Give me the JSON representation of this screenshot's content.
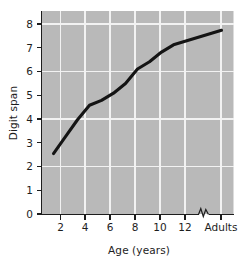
{
  "chart_data": {
    "type": "line",
    "title": "",
    "subtitle": "",
    "xlabel": "Age (years)",
    "ylabel": "Digit span",
    "x_tick_labels": [
      "2",
      "4",
      "6",
      "8",
      "10",
      "12",
      "Adults"
    ],
    "x_tick_values": [
      2,
      4,
      6,
      8,
      10,
      12,
      16
    ],
    "y_tick_labels": [
      "0",
      "1",
      "2",
      "3",
      "4",
      "5",
      "6",
      "7",
      "8"
    ],
    "y_tick_values": [
      0,
      1,
      2,
      3,
      4,
      5,
      6,
      7,
      8
    ],
    "xlim": [
      1,
      17
    ],
    "ylim": [
      0,
      8.4
    ],
    "grid": true,
    "grid_x_values": [
      2,
      4,
      6,
      8,
      10,
      12,
      16
    ],
    "grid_y_values": [
      2,
      4,
      6,
      8
    ],
    "legend": "none",
    "axis_break": {
      "axis": "x",
      "position_value": 14.1,
      "label": "axis-break-zigzag"
    },
    "series": [
      {
        "name": "Digit span",
        "color": "#141414",
        "x": [
          2,
          3,
          4,
          5,
          6,
          7,
          8,
          9,
          10,
          11,
          12,
          16
        ],
        "values": [
          2.5,
          3.2,
          3.9,
          4.5,
          4.7,
          5.0,
          5.4,
          6.0,
          6.3,
          6.7,
          7.0,
          7.6
        ]
      }
    ],
    "colors": {
      "plot_background": "#b9b9b9",
      "gridline": "#f2f2f2",
      "line": "#141414",
      "axis": "#1d1d1d",
      "page_background": "#ffffff"
    }
  }
}
